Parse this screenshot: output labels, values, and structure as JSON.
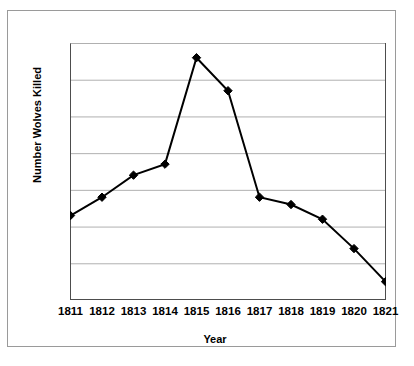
{
  "chart_data": {
    "type": "line",
    "title": "",
    "xlabel": "Year",
    "ylabel": "Number Wolves Killed",
    "categories": [
      "1811",
      "1812",
      "1813",
      "1814",
      "1815",
      "1816",
      "1817",
      "1818",
      "1819",
      "1820",
      "1821"
    ],
    "values": [
      23,
      28,
      34,
      37,
      66,
      57,
      28,
      26,
      22,
      14,
      5
    ],
    "series": [
      {
        "name": "Number Wolves Killed",
        "values": [
          23,
          28,
          34,
          37,
          66,
          57,
          28,
          26,
          22,
          14,
          5
        ]
      }
    ],
    "ylim": [
      0,
      70
    ],
    "yticks": [
      "0",
      "10",
      "20",
      "30",
      "40",
      "50",
      "60",
      "70"
    ],
    "ytick_values": [
      0,
      10,
      20,
      30,
      40,
      50,
      60,
      70
    ],
    "grid": "horizontal",
    "legend": "none",
    "marker": "diamond",
    "line_color": "#000000",
    "marker_color": "#000000",
    "grid_color": "#b0b0b0",
    "axis_color": "#4d4d4d",
    "border_color": "#9a9a9a",
    "background": "#ffffff"
  }
}
